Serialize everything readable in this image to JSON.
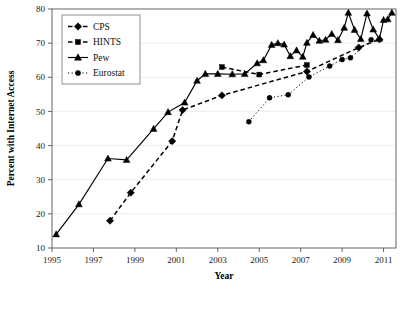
{
  "chart_data": {
    "type": "line",
    "title": "",
    "xlabel": "Year",
    "ylabel": "Percent with Internet Access",
    "xlim": [
      1995,
      2011.6
    ],
    "ylim": [
      10,
      80
    ],
    "xticks": [
      1995,
      1997,
      1999,
      2001,
      2003,
      2005,
      2007,
      2009,
      2011
    ],
    "xtick_labels": [
      "1995",
      "1997",
      "1999",
      "2001",
      "2003",
      "2005",
      "2007",
      "2009",
      "2011"
    ],
    "yticks": [
      10,
      20,
      30,
      40,
      50,
      60,
      70,
      80
    ],
    "ytick_labels": [
      "10",
      "20",
      "30",
      "40",
      "50",
      "60",
      "70",
      "80"
    ],
    "grid": true,
    "legend_position": "top-left",
    "series": [
      {
        "name": "CPS",
        "marker": "diamond",
        "linestyle": "dashed",
        "color": "#000000",
        "points": [
          [
            1997.8,
            18.0
          ],
          [
            1998.8,
            26.2
          ],
          [
            2000.8,
            41.3
          ],
          [
            2001.3,
            50.4
          ],
          [
            2003.2,
            54.7
          ],
          [
            2007.3,
            61.7
          ],
          [
            2009.8,
            68.7
          ],
          [
            2010.8,
            71.1
          ]
        ]
      },
      {
        "name": "HINTS",
        "marker": "square",
        "linestyle": "dashed",
        "color": "#000000",
        "points": [
          [
            2003.2,
            63.0
          ],
          [
            2005.0,
            60.8
          ],
          [
            2007.3,
            63.6
          ]
        ]
      },
      {
        "name": "Pew",
        "marker": "triangle",
        "linestyle": "solid",
        "color": "#000000",
        "points": [
          [
            1995.2,
            14.0
          ],
          [
            1996.3,
            22.8
          ],
          [
            1997.7,
            36.2
          ],
          [
            1998.6,
            35.8
          ],
          [
            1999.9,
            44.9
          ],
          [
            2000.6,
            49.8
          ],
          [
            2001.4,
            52.6
          ],
          [
            2002.0,
            59.0
          ],
          [
            2002.4,
            61.0
          ],
          [
            2003.0,
            61.0
          ],
          [
            2003.7,
            60.9
          ],
          [
            2004.3,
            61.0
          ],
          [
            2004.9,
            64.1
          ],
          [
            2005.2,
            65.0
          ],
          [
            2005.6,
            69.5
          ],
          [
            2005.9,
            70.0
          ],
          [
            2006.2,
            69.6
          ],
          [
            2006.5,
            66.2
          ],
          [
            2006.8,
            67.9
          ],
          [
            2007.1,
            66.0
          ],
          [
            2007.3,
            70.1
          ],
          [
            2007.6,
            72.4
          ],
          [
            2007.9,
            70.7
          ],
          [
            2008.2,
            71.0
          ],
          [
            2008.5,
            72.7
          ],
          [
            2008.8,
            70.9
          ],
          [
            2009.1,
            74.5
          ],
          [
            2009.3,
            78.9
          ],
          [
            2009.6,
            73.9
          ],
          [
            2009.9,
            71.2
          ],
          [
            2010.2,
            78.7
          ],
          [
            2010.5,
            74.0
          ],
          [
            2010.8,
            71.3
          ],
          [
            2011.0,
            76.8
          ],
          [
            2011.2,
            77.0
          ],
          [
            2011.4,
            78.9
          ]
        ]
      },
      {
        "name": "Eurostat",
        "marker": "circle",
        "linestyle": "dotted",
        "color": "#000000",
        "points": [
          [
            2004.5,
            47.0
          ],
          [
            2005.5,
            54.0
          ],
          [
            2006.4,
            54.9
          ],
          [
            2007.4,
            60.1
          ],
          [
            2008.4,
            63.3
          ],
          [
            2009.0,
            65.2
          ],
          [
            2009.4,
            65.7
          ],
          [
            2010.4,
            71.0
          ]
        ]
      }
    ]
  },
  "legend": {
    "items": [
      {
        "label": "CPS"
      },
      {
        "label": "HINTS"
      },
      {
        "label": "Pew"
      },
      {
        "label": "Eurostat"
      }
    ]
  }
}
